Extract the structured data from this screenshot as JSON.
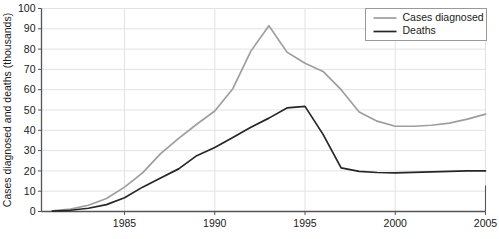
{
  "chart_data": {
    "type": "line",
    "title": "",
    "xlabel": "",
    "ylabel": "Cases diagnosed and deaths (thousands)",
    "xlim": [
      1980.4,
      2005.0
    ],
    "ylim": [
      0,
      100
    ],
    "grid": true,
    "legend_position": "top-right",
    "xticks": [
      "1985",
      "1990",
      "1995",
      "2000",
      "2005"
    ],
    "xtick_values": [
      1985,
      1990,
      1995,
      2000,
      2005
    ],
    "yticks": [
      "0",
      "10",
      "20",
      "30",
      "40",
      "50",
      "60",
      "70",
      "80",
      "90",
      "100"
    ],
    "ytick_values": [
      0,
      10,
      20,
      30,
      40,
      50,
      60,
      70,
      80,
      90,
      100
    ],
    "x": [
      1981,
      1982,
      1983,
      1984,
      1985,
      1986,
      1987,
      1988,
      1989,
      1990,
      1991,
      1992,
      1993,
      1994,
      1995,
      1996,
      1997,
      1998,
      1999,
      2000,
      2001,
      2002,
      2003,
      2004,
      2005
    ],
    "series": [
      {
        "name": "Cases diagnosed",
        "color": "#9e9e9e",
        "values": [
          0.3,
          1.2,
          3.1,
          6.4,
          12.0,
          19.0,
          28.5,
          36.0,
          43.0,
          49.5,
          60.5,
          79.0,
          91.5,
          78.5,
          73.0,
          69.0,
          60.0,
          49.0,
          44.5,
          42.0,
          42.0,
          42.5,
          43.5,
          45.5,
          48.0
        ]
      },
      {
        "name": "Deaths",
        "color": "#262626",
        "values": [
          0.2,
          0.6,
          1.6,
          3.4,
          6.8,
          12.0,
          16.5,
          21.0,
          27.5,
          31.5,
          36.5,
          41.5,
          46.0,
          51.0,
          51.8,
          38.0,
          21.5,
          19.8,
          19.2,
          19.0,
          19.3,
          19.5,
          19.8,
          20.0,
          20.0
        ]
      }
    ]
  },
  "legend": {
    "items": [
      {
        "label": "Cases diagnosed",
        "color": "#9e9e9e"
      },
      {
        "label": "Deaths",
        "color": "#262626"
      }
    ]
  },
  "colors": {
    "cases": "#9e9e9e",
    "deaths": "#262626",
    "axis": "#555555",
    "grid": "#e2e2e2",
    "text": "#1a1a1a",
    "legend_border": "#999999",
    "background": "#ffffff"
  }
}
